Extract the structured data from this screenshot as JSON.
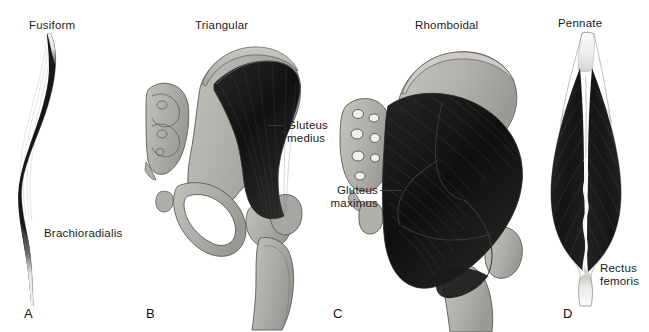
{
  "figure": {
    "width": 649,
    "height": 332,
    "background": "#ffffff"
  },
  "colors": {
    "muscle_dark": "#1c1c1c",
    "muscle_mid": "#3d3d3d",
    "tendon_light": "#f2f2f0",
    "bone_gray": "#b3b1ac",
    "bone_gray_dark": "#97958f",
    "outline": "#4a4a48",
    "text": "#1a1a1a",
    "leader_line": "#3a3a3a"
  },
  "panels": [
    {
      "id": "a",
      "letter": "A",
      "title": "Fusiform",
      "muscle_label": "Brachioradialis",
      "label_lines": [
        "Brachioradialis"
      ],
      "has_leader": false
    },
    {
      "id": "b",
      "letter": "B",
      "title": "Triangular",
      "muscle_label": "Gluteus medius",
      "label_lines": [
        "Gluteus",
        "medius"
      ],
      "has_leader": true
    },
    {
      "id": "c",
      "letter": "C",
      "title": "Rhomboidal",
      "muscle_label": "Gluteus maximus",
      "label_lines": [
        "Gluteus",
        "maximus"
      ],
      "has_leader": true
    },
    {
      "id": "d",
      "letter": "D",
      "title": "Pennate",
      "muscle_label": "Rectus femoris",
      "label_lines": [
        "Rectus",
        "femoris"
      ],
      "has_leader": false
    }
  ]
}
